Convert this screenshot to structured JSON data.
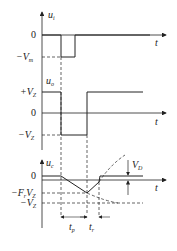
{
  "diagram": {
    "type": "waveform-timing-diagram",
    "panels": [
      {
        "id": "input",
        "y_label": "u_i",
        "x_label": "t",
        "levels": [
          {
            "label": "0",
            "name": "zero"
          },
          {
            "label": "-V_m",
            "name": "neg-vm"
          }
        ],
        "description": "Negative trigger pulse from 0 to -V_m"
      },
      {
        "id": "output",
        "y_label": "u_o",
        "x_label": "t",
        "levels": [
          {
            "label": "+V_Z",
            "name": "pos-vz"
          },
          {
            "label": "0",
            "name": "zero"
          },
          {
            "label": "-V_Z",
            "name": "neg-vz"
          }
        ],
        "description": "Output switches from +V_Z to -V_Z during t_p and recovery, then returns to +V_Z"
      },
      {
        "id": "capacitor",
        "y_label": "u_c",
        "x_label": "t",
        "levels": [
          {
            "label": "0",
            "name": "zero"
          },
          {
            "label": "-F_r V_Z",
            "name": "neg-fr-vz"
          },
          {
            "label": "-V_Z",
            "name": "neg-vz"
          }
        ],
        "annotations": [
          {
            "label": "V_D",
            "name": "diode-drop"
          },
          {
            "label": "t_p",
            "name": "pulse-width"
          },
          {
            "label": "t_r",
            "name": "recovery-time"
          }
        ],
        "description": "Capacitor voltage ramps down to -F_r V_Z during t_p, then recovers during t_r"
      }
    ],
    "labels": {
      "ui": "u",
      "ui_sub": "i",
      "uo": "u",
      "uo_sub": "o",
      "uc": "u",
      "uc_sub": "c",
      "t": "t",
      "zero": "0",
      "neg_vm": "−V",
      "neg_vm_sub": "m",
      "pos_vz": "+V",
      "vz_sub": "Z",
      "neg_vz": "−V",
      "neg_fr": "−F",
      "fr_sub": "r",
      "fr_v": "V",
      "vd": "V",
      "vd_sub": "D",
      "tp": "t",
      "tp_sub": "p",
      "tr": "t",
      "tr_sub": "r"
    }
  }
}
